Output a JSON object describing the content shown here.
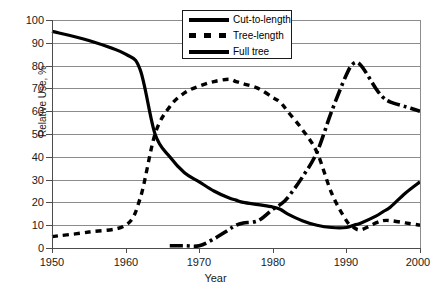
{
  "caption_remnant": "",
  "axes": {
    "y_title": "Relative Use, %",
    "x_title": "Year",
    "y_ticks": [
      "0",
      "10",
      "20",
      "30",
      "40",
      "50",
      "60",
      "70",
      "80",
      "90",
      "100"
    ],
    "x_ticks": [
      "1950",
      "1960",
      "1970",
      "1980",
      "1990",
      "2000"
    ]
  },
  "legend": {
    "items": [
      {
        "label": "Cut-to-length",
        "style": "solid",
        "color": "#000000"
      },
      {
        "label": "Tree-length",
        "style": "dashed",
        "color": "#000000"
      },
      {
        "label": "Full tree",
        "style": "dashdot",
        "color": "#000000"
      }
    ]
  },
  "chart_data": {
    "type": "line",
    "title": "",
    "xlabel": "Year",
    "ylabel": "Relative Use, %",
    "xlim": [
      1950,
      2000
    ],
    "ylim": [
      0,
      100
    ],
    "grid": true,
    "legend_position": "top-center",
    "x": [
      1950,
      1955,
      1960,
      1962,
      1964,
      1966,
      1968,
      1970,
      1972,
      1974,
      1975,
      1976,
      1978,
      1980,
      1981,
      1982,
      1984,
      1986,
      1988,
      1990,
      1991,
      1992,
      1994,
      1995,
      1996,
      1998,
      2000
    ],
    "series": [
      {
        "name": "Cut-to-length",
        "style": "solid",
        "color": "#000000",
        "values": [
          95,
          91,
          85,
          78,
          50,
          40,
          33,
          29,
          25,
          22,
          21,
          20,
          19,
          18,
          17,
          15,
          12,
          10,
          9,
          9,
          10,
          11,
          14,
          16,
          18,
          24,
          29
        ]
      },
      {
        "name": "Tree-length",
        "style": "dashed",
        "color": "#000000",
        "values": [
          5,
          7,
          10,
          22,
          50,
          62,
          68,
          71,
          73,
          74,
          73,
          72,
          70,
          66,
          64,
          60,
          52,
          42,
          24,
          12,
          9,
          8,
          11,
          12,
          12,
          11,
          10
        ]
      },
      {
        "name": "Full tree",
        "style": "dashdot",
        "color": "#000000",
        "values": [
          null,
          null,
          null,
          null,
          null,
          1,
          1,
          1,
          4,
          8,
          10,
          11,
          12,
          17,
          19,
          22,
          31,
          42,
          60,
          76,
          81,
          80,
          70,
          66,
          64,
          62,
          60
        ]
      }
    ],
    "annotations": [
      {
        "text": "Cut-to-length and Tree-length cross near 1964 at 50%"
      },
      {
        "text": "Tree-length peaks near 1974 at 74%"
      },
      {
        "text": "Full tree peaks near 1991 at 81%"
      },
      {
        "text": "Cut-to-length minimum near 1988 at 9%"
      }
    ]
  }
}
